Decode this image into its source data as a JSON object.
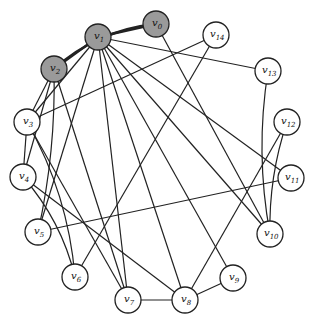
{
  "diagram": {
    "type": "graph",
    "node_radius": 13,
    "colors": {
      "highlighted_fill": "#9a9a9a",
      "normal_fill": "#ffffff",
      "stroke": "#222222"
    },
    "nodes": [
      {
        "id": "v0",
        "base": "v",
        "sub": "0",
        "x": 156,
        "y": 24,
        "highlighted": true
      },
      {
        "id": "v1",
        "base": "v",
        "sub": "1",
        "x": 98,
        "y": 37,
        "highlighted": true
      },
      {
        "id": "v2",
        "base": "v",
        "sub": "2",
        "x": 54,
        "y": 69,
        "highlighted": true
      },
      {
        "id": "v3",
        "base": "v",
        "sub": "3",
        "x": 27,
        "y": 122,
        "highlighted": false
      },
      {
        "id": "v4",
        "base": "v",
        "sub": "4",
        "x": 23,
        "y": 177,
        "highlighted": false
      },
      {
        "id": "v5",
        "base": "v",
        "sub": "5",
        "x": 38,
        "y": 232,
        "highlighted": false
      },
      {
        "id": "v6",
        "base": "v",
        "sub": "6",
        "x": 75,
        "y": 277,
        "highlighted": false
      },
      {
        "id": "v7",
        "base": "v",
        "sub": "7",
        "x": 128,
        "y": 300,
        "highlighted": false
      },
      {
        "id": "v8",
        "base": "v",
        "sub": "8",
        "x": 185,
        "y": 300,
        "highlighted": false
      },
      {
        "id": "v9",
        "base": "v",
        "sub": "9",
        "x": 233,
        "y": 278,
        "highlighted": false
      },
      {
        "id": "v10",
        "base": "v",
        "sub": "10",
        "x": 270,
        "y": 234,
        "highlighted": false
      },
      {
        "id": "v11",
        "base": "v",
        "sub": "11",
        "x": 291,
        "y": 178,
        "highlighted": false
      },
      {
        "id": "v12",
        "base": "v",
        "sub": "12",
        "x": 287,
        "y": 122,
        "highlighted": false
      },
      {
        "id": "v13",
        "base": "v",
        "sub": "13",
        "x": 268,
        "y": 71,
        "highlighted": false
      },
      {
        "id": "v14",
        "base": "v",
        "sub": "14",
        "x": 216,
        "y": 35,
        "highlighted": false
      }
    ],
    "edges": [
      {
        "from": "v0",
        "to": "v1",
        "bold": true
      },
      {
        "from": "v1",
        "to": "v2",
        "bold": true
      },
      {
        "from": "v0",
        "to": "v2",
        "bold": true,
        "curve": 18
      },
      {
        "from": "v1",
        "to": "v3"
      },
      {
        "from": "v1",
        "to": "v5"
      },
      {
        "from": "v1",
        "to": "v7"
      },
      {
        "from": "v1",
        "to": "v8"
      },
      {
        "from": "v1",
        "to": "v9"
      },
      {
        "from": "v1",
        "to": "v10"
      },
      {
        "from": "v1",
        "to": "v11"
      },
      {
        "from": "v1",
        "to": "v13"
      },
      {
        "from": "v0",
        "to": "v10"
      },
      {
        "from": "v2",
        "to": "v3"
      },
      {
        "from": "v2",
        "to": "v5",
        "curve": -10
      },
      {
        "from": "v2",
        "to": "v7"
      },
      {
        "from": "v3",
        "to": "v4"
      },
      {
        "from": "v3",
        "to": "v14"
      },
      {
        "from": "v3",
        "to": "v6",
        "curve": -18
      },
      {
        "from": "v3",
        "to": "v7"
      },
      {
        "from": "v4",
        "to": "v8"
      },
      {
        "from": "v4",
        "to": "v6",
        "curve": -14
      },
      {
        "from": "v4",
        "to": "v2"
      },
      {
        "from": "v5",
        "to": "v11"
      },
      {
        "from": "v6",
        "to": "v14"
      },
      {
        "from": "v7",
        "to": "v8"
      },
      {
        "from": "v8",
        "to": "v9"
      },
      {
        "from": "v8",
        "to": "v12"
      },
      {
        "from": "v10",
        "to": "v12",
        "curve": -10
      },
      {
        "from": "v10",
        "to": "v13",
        "curve": -14
      }
    ]
  }
}
